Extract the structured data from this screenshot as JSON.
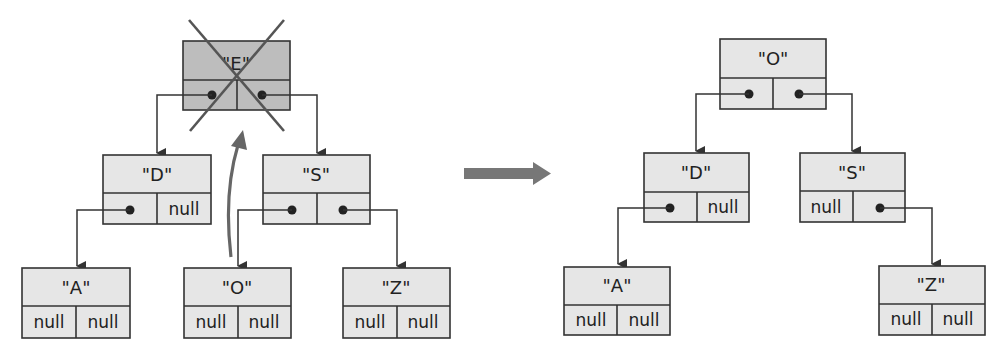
{
  "diagram": {
    "null_label": "null",
    "colors": {
      "node_fill": "#e6e6e6",
      "removed_node_fill": "#bdbdbd",
      "stroke": "#333333",
      "transition_arrow": "#777777"
    },
    "before": {
      "nodes": {
        "E": {
          "label": "\"E\"",
          "removed": true
        },
        "D": {
          "label": "\"D\"",
          "left": "A",
          "right": "null"
        },
        "S": {
          "label": "\"S\"",
          "left": "O",
          "right": "Z"
        },
        "A": {
          "label": "\"A\"",
          "left": "null",
          "right": "null"
        },
        "O": {
          "label": "\"O\"",
          "left": "null",
          "right": "null"
        },
        "Z": {
          "label": "\"Z\"",
          "left": "null",
          "right": "null"
        }
      },
      "root": "E",
      "annotations": [
        "cross-out on \"E\"",
        "curved arrow moving \"O\" up to root"
      ]
    },
    "after": {
      "nodes": {
        "O": {
          "label": "\"O\"",
          "left": "D",
          "right": "S"
        },
        "D": {
          "label": "\"D\"",
          "left": "A",
          "right": "null"
        },
        "S": {
          "label": "\"S\"",
          "left": "null",
          "right": "Z"
        },
        "A": {
          "label": "\"A\"",
          "left": "null",
          "right": "null"
        },
        "Z": {
          "label": "\"Z\"",
          "left": "null",
          "right": "null"
        }
      },
      "root": "O"
    }
  }
}
